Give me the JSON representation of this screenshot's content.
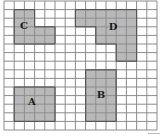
{
  "grid": {
    "columns": 15,
    "rows": 15,
    "origin_x": 4,
    "origin_y": 1,
    "cell_width": 10.2,
    "cell_height": 8.6,
    "line_color": "#8c8c8c",
    "background": "#ffffff"
  },
  "colors": {
    "shape_fill": "#b9b9b9",
    "shape_border": "#555555",
    "label": "#1a1a1a"
  },
  "shapes": [
    {
      "id": "C",
      "label": "C",
      "cells": [
        [
          1,
          1
        ],
        [
          2,
          1
        ],
        [
          1,
          2
        ],
        [
          2,
          2
        ],
        [
          1,
          3
        ],
        [
          2,
          3
        ],
        [
          3,
          3
        ],
        [
          4,
          3
        ],
        [
          1,
          4
        ],
        [
          2,
          4
        ],
        [
          3,
          4
        ],
        [
          4,
          4
        ]
      ],
      "label_pos": [
        24,
        26
      ]
    },
    {
      "id": "D",
      "label": "D",
      "cells": [
        [
          7,
          1
        ],
        [
          8,
          1
        ],
        [
          9,
          1
        ],
        [
          10,
          1
        ],
        [
          11,
          1
        ],
        [
          12,
          1
        ],
        [
          7,
          2
        ],
        [
          8,
          2
        ],
        [
          9,
          2
        ],
        [
          10,
          2
        ],
        [
          11,
          2
        ],
        [
          12,
          2
        ],
        [
          9,
          3
        ],
        [
          10,
          3
        ],
        [
          11,
          3
        ],
        [
          12,
          3
        ],
        [
          9,
          4
        ],
        [
          10,
          4
        ],
        [
          11,
          4
        ],
        [
          12,
          4
        ],
        [
          11,
          5
        ],
        [
          12,
          5
        ],
        [
          11,
          6
        ],
        [
          12,
          6
        ]
      ],
      "label_pos": [
        113,
        27
      ]
    },
    {
      "id": "A",
      "label": "A",
      "cells": [
        [
          1,
          10
        ],
        [
          2,
          10
        ],
        [
          3,
          10
        ],
        [
          4,
          10
        ],
        [
          1,
          11
        ],
        [
          2,
          11
        ],
        [
          3,
          11
        ],
        [
          4,
          11
        ],
        [
          1,
          12
        ],
        [
          2,
          12
        ],
        [
          3,
          12
        ],
        [
          4,
          12
        ],
        [
          1,
          13
        ],
        [
          2,
          13
        ],
        [
          3,
          13
        ],
        [
          4,
          13
        ]
      ],
      "label_pos": [
        32,
        102
      ]
    },
    {
      "id": "B",
      "label": "B",
      "cells": [
        [
          8,
          8
        ],
        [
          9,
          8
        ],
        [
          10,
          8
        ],
        [
          8,
          9
        ],
        [
          9,
          9
        ],
        [
          10,
          9
        ],
        [
          8,
          10
        ],
        [
          9,
          10
        ],
        [
          10,
          10
        ],
        [
          8,
          11
        ],
        [
          9,
          11
        ],
        [
          10,
          11
        ],
        [
          8,
          12
        ],
        [
          9,
          12
        ],
        [
          10,
          12
        ],
        [
          8,
          13
        ],
        [
          9,
          13
        ],
        [
          10,
          13
        ]
      ],
      "label_pos": [
        101,
        95
      ]
    }
  ]
}
